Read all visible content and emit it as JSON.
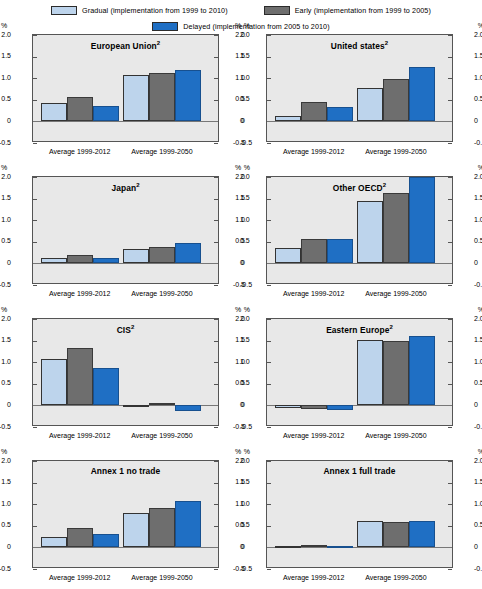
{
  "legend": {
    "items": [
      {
        "key": "gradual",
        "label": "Gradual (implementation from 1999 to 2010)",
        "color": "#bdd4ec"
      },
      {
        "key": "early",
        "label": "Early (implementation from 1999 to 2005)",
        "color": "#6e6e6e"
      },
      {
        "key": "delayed",
        "label": "Delayed (implementation from 2005 to 2010)",
        "color": "#1f6fc4"
      }
    ]
  },
  "axis": {
    "unit": "%",
    "ticks": [
      "2.0",
      "1.5",
      "1.0",
      "0.5",
      "0",
      "-0.5"
    ],
    "tick_values": [
      2.0,
      1.5,
      1.0,
      0.5,
      0,
      -0.5
    ],
    "ymin": -0.5,
    "ymax": 2.0
  },
  "categories": [
    "Average 1999-2012",
    "Average 1999-2050"
  ],
  "chart_data": {
    "type": "bar",
    "title": "",
    "xlabel": "",
    "ylabel": "%",
    "ylim": [
      -0.5,
      2.0
    ],
    "grid": false,
    "legend_position": "top",
    "categories": [
      "Average 1999-2012",
      "Average 1999-2050"
    ],
    "series_names": [
      "Gradual",
      "Early",
      "Delayed"
    ],
    "series_colors": [
      "#bdd4ec",
      "#6e6e6e",
      "#1f6fc4"
    ],
    "panels": [
      {
        "title": "European Union",
        "superscript": "2",
        "series": [
          {
            "name": "Gradual",
            "values": [
              0.43,
              1.07
            ]
          },
          {
            "name": "Early",
            "values": [
              0.57,
              1.13
            ]
          },
          {
            "name": "Delayed",
            "values": [
              0.35,
              1.18
            ]
          }
        ]
      },
      {
        "title": "United states",
        "superscript": "2",
        "series": [
          {
            "name": "Gradual",
            "values": [
              0.13,
              0.78
            ]
          },
          {
            "name": "Early",
            "values": [
              0.45,
              0.97
            ]
          },
          {
            "name": "Delayed",
            "values": [
              0.33,
              1.25
            ]
          }
        ]
      },
      {
        "title": "Japan",
        "superscript": "2",
        "series": [
          {
            "name": "Gradual",
            "values": [
              0.13,
              0.33
            ]
          },
          {
            "name": "Early",
            "values": [
              0.2,
              0.38
            ]
          },
          {
            "name": "Delayed",
            "values": [
              0.12,
              0.47
            ]
          }
        ]
      },
      {
        "title": "Other OECD",
        "superscript": "2",
        "series": [
          {
            "name": "Gradual",
            "values": [
              0.35,
              1.45
            ]
          },
          {
            "name": "Early",
            "values": [
              0.57,
              1.62
            ]
          },
          {
            "name": "Delayed",
            "values": [
              0.56,
              2.0
            ]
          }
        ]
      },
      {
        "title": "CIS",
        "superscript": "2",
        "series": [
          {
            "name": "Gradual",
            "values": [
              1.07,
              -0.03
            ]
          },
          {
            "name": "Early",
            "values": [
              1.33,
              0.05
            ]
          },
          {
            "name": "Delayed",
            "values": [
              0.87,
              -0.12
            ]
          }
        ]
      },
      {
        "title": "Eastern Europe",
        "superscript": "2",
        "series": [
          {
            "name": "Gradual",
            "values": [
              -0.05,
              1.52
            ]
          },
          {
            "name": "Early",
            "values": [
              -0.08,
              1.5
            ]
          },
          {
            "name": "Delayed",
            "values": [
              -0.1,
              1.6
            ]
          }
        ]
      },
      {
        "title": "Annex 1 no trade",
        "superscript": "",
        "series": [
          {
            "name": "Gradual",
            "values": [
              0.25,
              0.79
            ]
          },
          {
            "name": "Early",
            "values": [
              0.44,
              0.91
            ]
          },
          {
            "name": "Delayed",
            "values": [
              0.3,
              1.08
            ]
          }
        ]
      },
      {
        "title": "Annex 1 full trade",
        "superscript": "",
        "series": [
          {
            "name": "Gradual",
            "values": [
              0.04,
              0.6
            ]
          },
          {
            "name": "Early",
            "values": [
              0.06,
              0.59
            ]
          },
          {
            "name": "Delayed",
            "values": [
              0.03,
              0.61
            ]
          }
        ]
      }
    ]
  }
}
